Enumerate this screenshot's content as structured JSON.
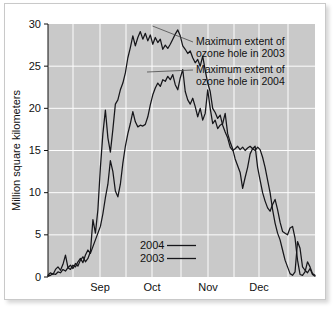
{
  "figure": {
    "background_color": "#ffffff",
    "plot_background_color": "#c9c9c9",
    "gridline_color": "#fdfdfd",
    "line_color": "#16161a"
  },
  "chart_data": {
    "type": "line",
    "title": "",
    "xlabel": "",
    "ylabel": "Million square kilometers",
    "ylim": [
      0,
      30
    ],
    "yticks": [
      0,
      5,
      10,
      15,
      20,
      25,
      30
    ],
    "ytick_labels": [
      "0",
      "5",
      "10",
      "15",
      "20",
      "25",
      "30"
    ],
    "xtick_labels": [
      "Sep",
      "Oct",
      "Nov",
      "Dec"
    ],
    "xlim_description": "mid-August through mid-December",
    "grid": true,
    "legend_position": "bottom-center-inside",
    "legend_entries": [
      "2004",
      "2003"
    ],
    "annotations": [
      {
        "id": "max-2003",
        "text_line1": "Maximum extent of",
        "text_line2": "ozone hole in 2003",
        "points_to_value": 29.3,
        "points_to_date": "late September 2003"
      },
      {
        "id": "max-2004",
        "text_line1": "Maximum extent of",
        "text_line2": "ozone hole in 2004",
        "points_to_value": 24.6,
        "points_to_date": "late September 2004"
      }
    ],
    "series": [
      {
        "name": "2003",
        "peak_value": 29.3,
        "values": [
          0.2,
          0.5,
          0.3,
          0.9,
          1.2,
          0.8,
          1.5,
          2.6,
          1.1,
          1.4,
          1.0,
          1.6,
          1.3,
          2.0,
          2.4,
          1.8,
          2.2,
          3.0,
          6.8,
          5.2,
          8.0,
          13.0,
          17.0,
          19.8,
          16.5,
          14.8,
          17.5,
          20.5,
          21.0,
          22.2,
          23.0,
          24.2,
          26.0,
          27.2,
          28.6,
          27.4,
          28.4,
          29.1,
          28.2,
          28.9,
          28.0,
          28.7,
          27.6,
          28.4,
          27.8,
          28.2,
          27.0,
          27.5,
          27.1,
          27.6,
          28.2,
          28.8,
          29.3,
          28.6,
          27.4,
          27.0,
          26.5,
          26.8,
          26.0,
          25.4,
          25.8,
          25.0,
          26.2,
          24.5,
          23.0,
          22.0,
          20.0,
          19.5,
          18.8,
          19.2,
          18.0,
          17.2,
          16.5,
          15.4,
          15.0,
          15.2,
          15.5,
          15.1,
          15.4,
          15.0,
          15.3,
          15.5,
          15.2,
          15.5,
          13.0,
          11.5,
          10.0,
          9.0,
          8.2,
          7.8,
          8.6,
          9.2,
          8.0,
          6.5,
          5.4,
          5.2,
          5.0,
          5.8,
          6.0,
          4.6,
          2.0,
          0.3,
          0.2,
          0.6,
          1.8,
          1.2,
          0.4,
          0.2
        ]
      },
      {
        "name": "2004",
        "peak_value": 24.6,
        "values": [
          0.1,
          0.2,
          0.4,
          0.3,
          0.6,
          0.5,
          0.9,
          0.7,
          1.1,
          0.9,
          1.4,
          1.2,
          1.8,
          2.2,
          1.7,
          2.6,
          3.2,
          2.8,
          3.6,
          4.4,
          5.2,
          6.0,
          7.5,
          9.4,
          11.0,
          13.8,
          12.5,
          10.2,
          9.5,
          11.0,
          13.5,
          15.5,
          17.0,
          18.2,
          19.6,
          18.4,
          17.8,
          18.0,
          17.9,
          18.1,
          19.0,
          20.4,
          21.6,
          22.4,
          23.0,
          22.6,
          23.4,
          23.2,
          23.8,
          23.4,
          24.0,
          22.8,
          22.2,
          23.6,
          24.6,
          22.0,
          21.0,
          20.5,
          21.2,
          20.2,
          19.0,
          20.0,
          18.6,
          19.4,
          22.2,
          20.0,
          18.2,
          18.6,
          17.6,
          18.0,
          18.2,
          19.4,
          17.0,
          16.0,
          15.2,
          14.0,
          13.2,
          12.4,
          10.5,
          11.8,
          13.0,
          14.6,
          15.2,
          15.0,
          15.4,
          15.1,
          14.2,
          13.0,
          11.5,
          10.0,
          8.0,
          6.4,
          5.2,
          4.4,
          3.2,
          2.0,
          1.2,
          0.4,
          0.2,
          0.6,
          4.2,
          3.4,
          1.2,
          0.8,
          0.5,
          1.0,
          0.3,
          0.1
        ]
      }
    ]
  }
}
